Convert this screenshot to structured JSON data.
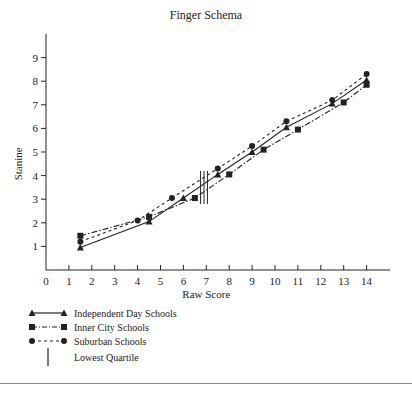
{
  "chart_data": {
    "type": "line",
    "title": "Finger Schema",
    "xlabel": "Raw Score",
    "ylabel": "Stanine",
    "xlim": [
      0,
      14
    ],
    "ylim": [
      0,
      9
    ],
    "x_ticks": [
      0,
      1,
      2,
      3,
      4,
      5,
      6,
      7,
      8,
      9,
      10,
      11,
      12,
      13,
      14
    ],
    "y_ticks": [
      1,
      2,
      3,
      4,
      5,
      6,
      7,
      8,
      9
    ],
    "grid": false,
    "legend_position": "bottom-left",
    "series": [
      {
        "name": "Independent Day Schools",
        "marker": "triangle",
        "line": "solid",
        "points": [
          [
            1.5,
            0.95
          ],
          [
            4.5,
            2.05
          ],
          [
            6,
            3.05
          ],
          [
            7.5,
            4.05
          ],
          [
            9,
            5.0
          ],
          [
            10.5,
            6.05
          ],
          [
            12.5,
            7.05
          ],
          [
            14,
            8.05
          ]
        ]
      },
      {
        "name": "Inner City Schools",
        "marker": "square",
        "line": "dash-dot",
        "points": [
          [
            1.5,
            1.45
          ],
          [
            4.5,
            2.25
          ],
          [
            6.5,
            3.05
          ],
          [
            8,
            4.05
          ],
          [
            9.5,
            5.1
          ],
          [
            11,
            5.95
          ],
          [
            13,
            7.1
          ],
          [
            14,
            7.85
          ]
        ]
      },
      {
        "name": "Suburban Schools",
        "marker": "circle",
        "line": "dashed",
        "points": [
          [
            1.5,
            1.2
          ],
          [
            4,
            2.1
          ],
          [
            5.5,
            3.05
          ],
          [
            7.5,
            4.3
          ],
          [
            9,
            5.25
          ],
          [
            10.5,
            6.3
          ],
          [
            12.5,
            7.2
          ],
          [
            14,
            8.3
          ]
        ]
      }
    ],
    "annotations": [
      {
        "name": "Lowest Quartile",
        "type": "vertical-lines",
        "x": [
          6.75,
          6.9,
          7.05
        ],
        "y_range": [
          2.8,
          4.2
        ]
      }
    ]
  },
  "legend": {
    "items": [
      {
        "label": "Independent Day Schools"
      },
      {
        "label": "Inner City Schools"
      },
      {
        "label": "Suburban Schools"
      },
      {
        "label": "Lowest Quartile"
      }
    ]
  },
  "colors": {
    "ink": "#222222",
    "rule": "#888888"
  }
}
